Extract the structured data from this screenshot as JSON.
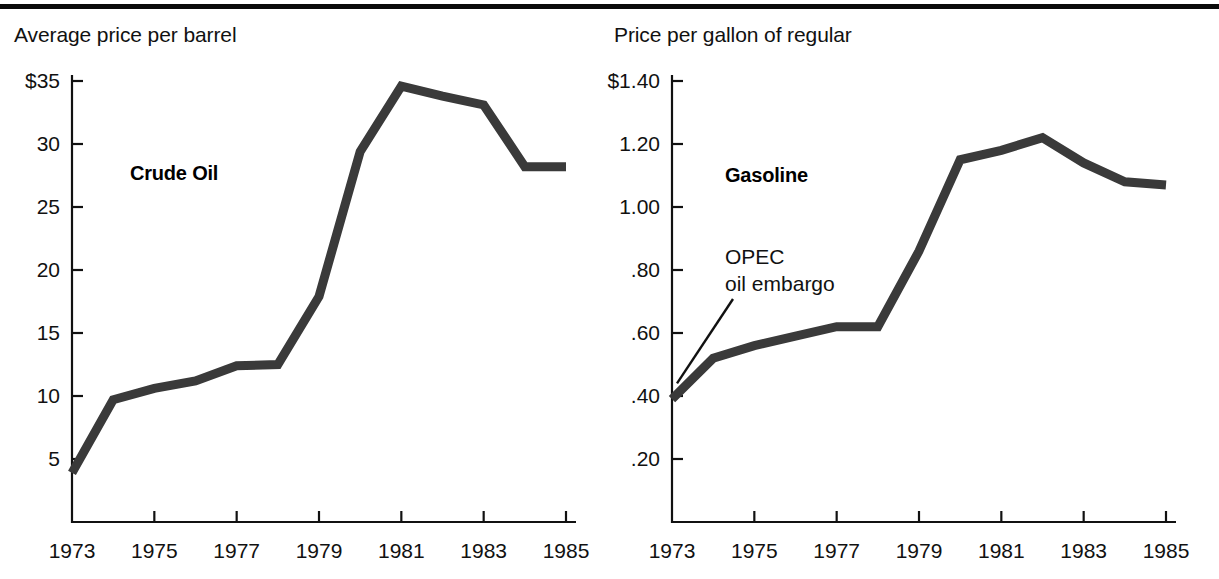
{
  "figure": {
    "top_rule": true,
    "line_color": "#3a3a3a",
    "axis_color": "#111111",
    "background": "#ffffff"
  },
  "panels": [
    {
      "id": "crude",
      "caption": "Average price per barrel",
      "series_label": "Crude Oil",
      "y_ticks": [
        "$35",
        "30",
        "25",
        "20",
        "15",
        "10",
        "5"
      ],
      "x_ticks": [
        "1973",
        "1975",
        "1977",
        "1979",
        "1981",
        "1983",
        "1985"
      ]
    },
    {
      "id": "gasoline",
      "caption": "Price per gallon of regular",
      "series_label": "Gasoline",
      "annotation_line1": "OPEC",
      "annotation_line2": "oil embargo",
      "y_ticks": [
        "$1.40",
        "1.20",
        "1.00",
        ".80",
        ".60",
        ".40",
        ".20"
      ],
      "x_ticks": [
        "1973",
        "1975",
        "1977",
        "1979",
        "1981",
        "1983",
        "1985"
      ]
    }
  ],
  "chart_data": [
    {
      "type": "line",
      "title": "Crude Oil",
      "subtitle": "Average price per barrel",
      "xlabel": "",
      "ylabel": "Average price per barrel",
      "x": [
        1973,
        1974,
        1975,
        1976,
        1977,
        1978,
        1979,
        1980,
        1981,
        1982,
        1983,
        1984,
        1985
      ],
      "values": [
        3.9,
        9.7,
        10.6,
        11.2,
        12.4,
        12.5,
        17.9,
        29.4,
        34.6,
        33.8,
        33.1,
        28.2,
        28.2
      ],
      "xlim": [
        1973,
        1985
      ],
      "ylim": [
        0,
        35
      ],
      "ytick_values": [
        35,
        30,
        25,
        20,
        15,
        10,
        5
      ],
      "ytick_labels": [
        "$35",
        "30",
        "25",
        "20",
        "15",
        "10",
        "5"
      ],
      "xtick_values": [
        1973,
        1975,
        1977,
        1979,
        1981,
        1983,
        1985
      ],
      "xtick_labels": [
        "1973",
        "1975",
        "1977",
        "1979",
        "1981",
        "1983",
        "1985"
      ],
      "grid": false,
      "legend": "none",
      "annotations": [
        {
          "text": "Crude Oil",
          "x": 1975.2,
          "y": 26.5
        }
      ]
    },
    {
      "type": "line",
      "title": "Gasoline",
      "subtitle": "Price per gallon of regular",
      "xlabel": "",
      "ylabel": "Price per gallon of regular",
      "x": [
        1973,
        1974,
        1975,
        1976,
        1977,
        1978,
        1979,
        1980,
        1981,
        1982,
        1983,
        1984,
        1985
      ],
      "values": [
        0.39,
        0.52,
        0.56,
        0.59,
        0.62,
        0.62,
        0.86,
        1.15,
        1.18,
        1.22,
        1.14,
        1.08,
        1.07
      ],
      "xlim": [
        1973,
        1985
      ],
      "ylim": [
        0,
        1.4
      ],
      "ytick_values": [
        1.4,
        1.2,
        1.0,
        0.8,
        0.6,
        0.4,
        0.2
      ],
      "ytick_labels": [
        "$1.40",
        "1.20",
        "1.00",
        ".80",
        ".60",
        ".40",
        ".20"
      ],
      "xtick_values": [
        1973,
        1975,
        1977,
        1979,
        1981,
        1983,
        1985
      ],
      "xtick_labels": [
        "1973",
        "1975",
        "1977",
        "1979",
        "1981",
        "1983",
        "1985"
      ],
      "grid": false,
      "legend": "none",
      "annotations": [
        {
          "text": "Gasoline",
          "x": 1975.0,
          "y": 1.04
        },
        {
          "text": "OPEC oil embargo",
          "x": 1974.9,
          "y": 0.79,
          "points_to": {
            "x": 1973,
            "y": 0.42
          }
        }
      ]
    }
  ]
}
